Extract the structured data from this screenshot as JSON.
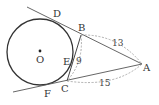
{
  "diagram": {
    "type": "geometry",
    "colors": {
      "stroke": "#333333",
      "dashed": "#999999",
      "background": "#ffffff"
    },
    "circle": {
      "center_label": "O",
      "cx": 40,
      "cy": 52,
      "r": 33
    },
    "points": {
      "O": {
        "label": "O",
        "x": 40,
        "y": 51
      },
      "D": {
        "label": "D",
        "x": 55,
        "y": 20
      },
      "B": {
        "label": "B",
        "x": 81,
        "y": 35
      },
      "A": {
        "label": "A",
        "x": 142,
        "y": 64
      },
      "C": {
        "label": "C",
        "x": 67,
        "y": 81
      },
      "E": {
        "label": "E",
        "x": 72,
        "y": 61
      },
      "F": {
        "label": "F",
        "x": 41,
        "y": 86
      }
    },
    "measurements": {
      "AB": "13",
      "BC": "9",
      "AC": "15"
    }
  }
}
